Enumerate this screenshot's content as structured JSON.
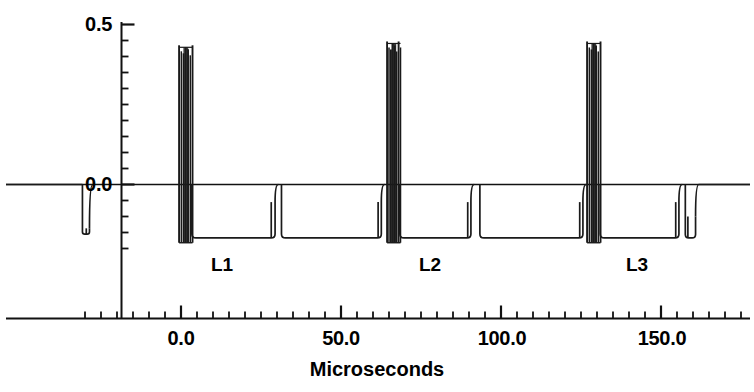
{
  "chart_data": {
    "type": "line",
    "title": "",
    "xlabel": "Microseconds",
    "ylabel": "",
    "xlim": [
      -32,
      179
    ],
    "ylim": [
      -0.205,
      0.55
    ],
    "grid": false,
    "legend": "none",
    "x_ticks_major": [
      {
        "value": 0.0,
        "label": "0.0"
      },
      {
        "value": 50.0,
        "label": "50.0"
      },
      {
        "value": 100.0,
        "label": "100.0"
      },
      {
        "value": 150.0,
        "label": "150.0"
      }
    ],
    "x_tick_minor_step": 5.0,
    "y_ticks_major": [
      {
        "value": 0.0,
        "label": "0.0"
      },
      {
        "value": 0.5,
        "label": "0.5"
      }
    ],
    "y_tick_minor_step": 0.05,
    "annotations": [
      {
        "text": "L1",
        "x": 19.0,
        "y": -0.11
      },
      {
        "text": "L2",
        "x": 85.0,
        "y": -0.11
      },
      {
        "text": "L3",
        "x": 149.0,
        "y": -0.11
      }
    ],
    "series": [
      {
        "name": "waveform",
        "color": "#1a1a1a",
        "baseline": 0.0,
        "low_level": -0.172,
        "burst_top": 0.435,
        "burst_bottom": -0.182,
        "notes": "Square-wave pulse train with three high-frequency ringing bursts labelled L1, L2, L3",
        "bursts": [
          {
            "label": "L1",
            "x_center": 1.5,
            "x_start": -0.6,
            "x_end": 3.6,
            "top": 0.435,
            "bottom": -0.182,
            "n_lines": 7
          },
          {
            "label": "L2",
            "x_center": 66.5,
            "x_start": 64.4,
            "x_end": 68.6,
            "top": 0.447,
            "bottom": -0.182,
            "n_lines": 8
          },
          {
            "label": "L3",
            "x_center": 129.0,
            "x_start": 126.9,
            "x_end": 131.1,
            "top": 0.447,
            "bottom": -0.182,
            "n_lines": 7
          }
        ],
        "pulses": [
          {
            "x_start": -30.8,
            "x_end": -28.6,
            "level": -0.155,
            "step_x": -29.6,
            "step_level": -0.137
          },
          {
            "x_start": 3.4,
            "x_end": 29.4,
            "level": -0.167,
            "step_x": 28.2,
            "step_level": -0.055
          },
          {
            "x_start": 31.4,
            "x_end": 62.6,
            "level": -0.167,
            "step_x": 61.6,
            "step_level": -0.055
          },
          {
            "x_start": 68.4,
            "x_end": 90.6,
            "level": -0.167,
            "step_x": 89.6,
            "step_level": -0.055
          },
          {
            "x_start": 93.4,
            "x_end": 125.6,
            "level": -0.167,
            "step_x": 124.6,
            "step_level": -0.055
          },
          {
            "x_start": 131.0,
            "x_end": 155.6,
            "level": -0.167,
            "step_x": 154.6,
            "step_level": -0.055
          },
          {
            "x_start": 157.6,
            "x_end": 160.8,
            "level": -0.167,
            "step_x": 158.4,
            "step_level": -0.1
          }
        ]
      }
    ]
  },
  "axis": {
    "x_title": "Microseconds",
    "y_tick_0": "0.0",
    "y_tick_1": "0.5",
    "x_tick_0": "0.0",
    "x_tick_1": "50.0",
    "x_tick_2": "100.0",
    "x_tick_3": "150.0"
  },
  "labels": {
    "l1": "L1",
    "l2": "L2",
    "l3": "L3"
  }
}
